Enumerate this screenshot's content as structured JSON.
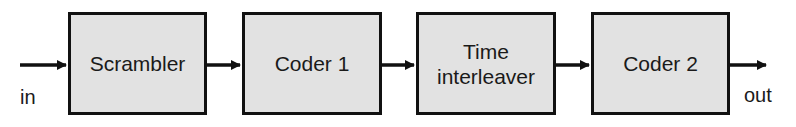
{
  "diagram": {
    "input_label": "in",
    "output_label": "out",
    "blocks": [
      {
        "label": "Scrambler"
      },
      {
        "label": "Coder 1"
      },
      {
        "label": "Time interleaver",
        "line1": "Time",
        "line2": "interleaver"
      },
      {
        "label": "Coder 2"
      }
    ],
    "colors": {
      "block_fill": "#e2e2e2",
      "stroke": "#111111"
    }
  }
}
